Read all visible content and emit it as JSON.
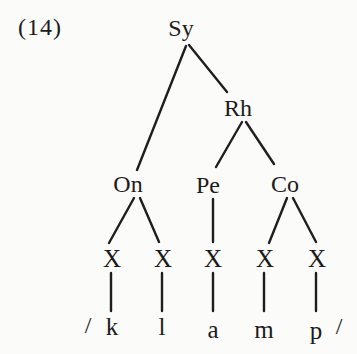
{
  "figure": {
    "example_label": "(14)"
  },
  "tree": {
    "syllable_label": "Sy",
    "rhyme_label": "Rh",
    "onset_label": "On",
    "peak_label": "Pe",
    "coda_label": "Co",
    "timing_slots": [
      "X",
      "X",
      "X",
      "X",
      "X"
    ],
    "phonemes": [
      "k",
      "l",
      "a",
      "m",
      "p"
    ],
    "slash_open": "/",
    "slash_close": "/"
  },
  "colors": {
    "background": "#fbfbf9",
    "ink": "#1b1b1b"
  }
}
